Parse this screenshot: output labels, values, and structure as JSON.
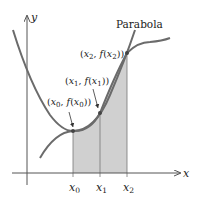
{
  "diagram": {
    "axes": {
      "x_label": "x",
      "y_label": "y"
    },
    "curve_label": "Parabola",
    "points": [
      {
        "id": "p0",
        "label": "(x0, f(x0))",
        "x_label": "x0"
      },
      {
        "id": "p1",
        "label": "(x1, f(x1))",
        "x_label": "x1"
      },
      {
        "id": "p2",
        "label": "(x2, f(x2))",
        "x_label": "x2"
      }
    ],
    "colors": {
      "curve": "#6b6b6b",
      "axis": "#555555",
      "shade": "#d0d0d0",
      "text": "#222222"
    }
  }
}
